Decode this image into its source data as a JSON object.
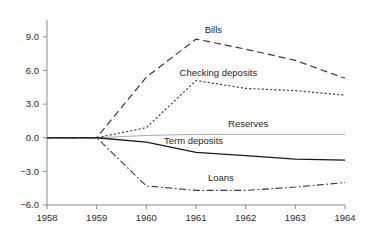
{
  "chart_data": {
    "type": "line",
    "title": "",
    "subtitle": "",
    "xlabel": "",
    "ylabel": "",
    "x": [
      1958,
      1959,
      1960,
      1961,
      1962,
      1963,
      1964
    ],
    "xlim": [
      1958,
      1964
    ],
    "ylim": [
      -6.0,
      10.5
    ],
    "grid": false,
    "legend_position": "inline-annotations",
    "xticks": [
      "1958",
      "1959",
      "1960",
      "1961",
      "1962",
      "1963",
      "1964"
    ],
    "yticks": [
      "9.0",
      "6.0",
      "3.0",
      "0.0",
      "−3.0",
      "−6.0"
    ],
    "ytick_values": [
      9.0,
      6.0,
      3.0,
      0.0,
      -3.0,
      -6.0
    ],
    "series": [
      {
        "name": "Bills",
        "style": "long-dashed",
        "color": "#3a3a3a",
        "values": [
          0.0,
          0.0,
          5.4,
          8.8,
          7.9,
          6.9,
          5.3
        ]
      },
      {
        "name": "Checking deposits",
        "style": "dotted",
        "color": "#3a3a3a",
        "values": [
          0.0,
          0.0,
          0.9,
          5.1,
          4.4,
          4.2,
          3.8
        ]
      },
      {
        "name": "Reserves",
        "style": "solid-thin",
        "color": "#a0a0a0",
        "values": [
          0.0,
          0.0,
          0.2,
          0.3,
          0.3,
          0.3,
          0.3
        ]
      },
      {
        "name": "Term deposits",
        "style": "solid",
        "color": "#1a1a1a",
        "values": [
          0.0,
          0.0,
          -0.4,
          -1.3,
          -1.6,
          -1.9,
          -2.0
        ]
      },
      {
        "name": "Loans",
        "style": "dash-dot",
        "color": "#3a3a3a",
        "values": [
          0.0,
          0.0,
          -4.3,
          -4.7,
          -4.7,
          -4.4,
          -4.0
        ]
      }
    ],
    "annotations": [
      {
        "text": "Bills",
        "x": 1961.35,
        "y": 9.3
      },
      {
        "text": "Checking deposits",
        "x": 1961.45,
        "y": 5.55
      },
      {
        "text": "Reserves",
        "x": 1962.05,
        "y": 0.95
      },
      {
        "text": "Term deposits",
        "x": 1960.95,
        "y": -0.6
      },
      {
        "text": "Loans",
        "x": 1961.5,
        "y": -3.85
      }
    ]
  }
}
